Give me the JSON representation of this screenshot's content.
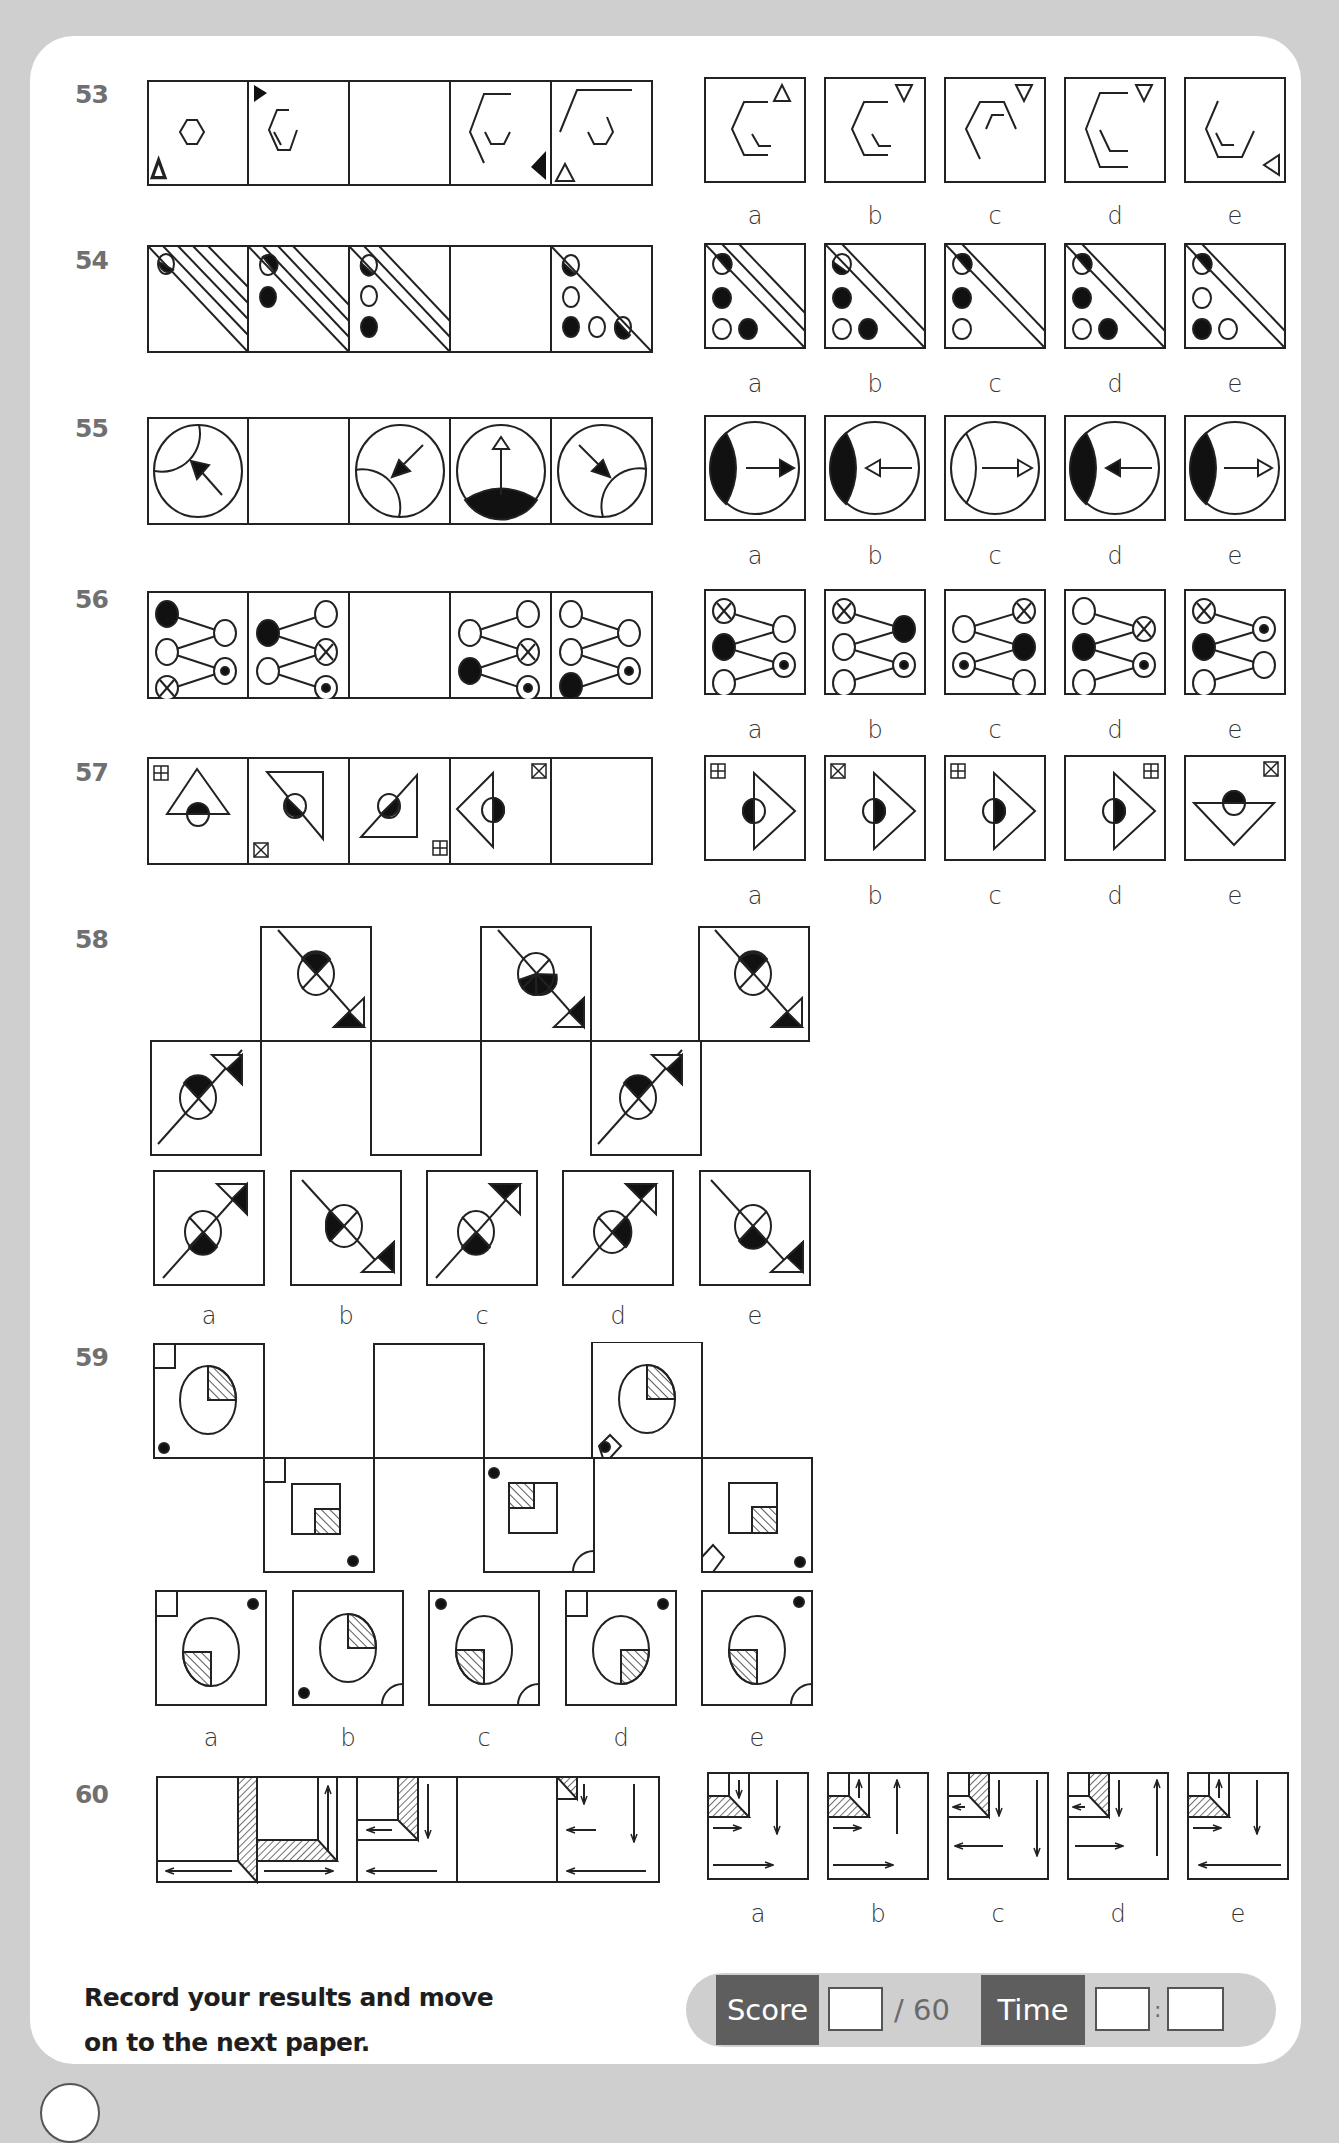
{
  "questions": [
    {
      "number": "53",
      "options": [
        "a",
        "b",
        "c",
        "d",
        "e"
      ]
    },
    {
      "number": "54",
      "options": [
        "a",
        "b",
        "c",
        "d",
        "e"
      ]
    },
    {
      "number": "55",
      "options": [
        "a",
        "b",
        "c",
        "d",
        "e"
      ]
    },
    {
      "number": "56",
      "options": [
        "a",
        "b",
        "c",
        "d",
        "e"
      ]
    },
    {
      "number": "57",
      "options": [
        "a",
        "b",
        "c",
        "d",
        "e"
      ]
    },
    {
      "number": "58",
      "options": [
        "a",
        "b",
        "c",
        "d",
        "e"
      ]
    },
    {
      "number": "59",
      "options": [
        "a",
        "b",
        "c",
        "d",
        "e"
      ]
    },
    {
      "number": "60",
      "options": [
        "a",
        "b",
        "c",
        "d",
        "e"
      ]
    }
  ],
  "footer": {
    "instruction_line1": "Record your results and move",
    "instruction_line2": "on to the next paper.",
    "score_label": "Score",
    "score_total": "/ 60",
    "time_label": "Time",
    "time_separator": ":",
    "score_value": "",
    "time_minutes": "",
    "time_seconds": ""
  },
  "colors": {
    "page_bg": "#cfcfcf",
    "panel_bg": "#ffffff",
    "label_dark": "#5e5e5e",
    "qnum": "#707070"
  }
}
